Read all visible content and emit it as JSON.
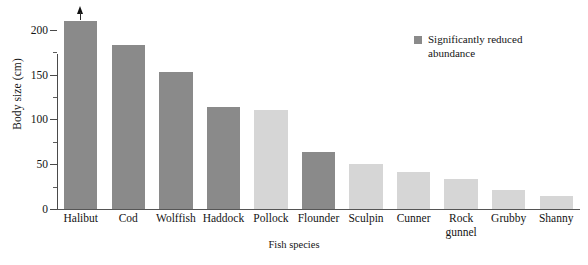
{
  "chart_data": {
    "type": "bar",
    "title": "",
    "xlabel": "Fish species",
    "ylabel": "Body size (cm)",
    "ylim": [
      0,
      220
    ],
    "yticks": [
      0,
      50,
      100,
      150,
      200
    ],
    "ytick_labels": [
      "0",
      "50",
      "100",
      "150",
      "200"
    ],
    "yminor_ticks": [
      25,
      75,
      125,
      175
    ],
    "grid": false,
    "categories": [
      "Halibut",
      "Cod",
      "Wolffish",
      "Haddock",
      "Pollock",
      "Flounder",
      "Sculpin",
      "Cunner",
      "Rock gunnel",
      "Grubby",
      "Shanny"
    ],
    "values": [
      210,
      183,
      153,
      114,
      111,
      64,
      50,
      41,
      33,
      21,
      14
    ],
    "bar_states": [
      "reduced",
      "reduced",
      "reduced",
      "reduced",
      "not-reduced",
      "reduced",
      "not-reduced",
      "not-reduced",
      "not-reduced",
      "not-reduced",
      "not-reduced"
    ],
    "annotations": [
      {
        "category": "Halibut",
        "kind": "up-arrow",
        "note": "value extends beyond axis"
      }
    ],
    "legend": {
      "position": "top-right",
      "entries": [
        {
          "label": "Significantly reduced abundance",
          "color": "#8a8a8a"
        }
      ]
    },
    "colors": {
      "reduced": "#8a8a8a",
      "not_reduced": "#d6d6d6",
      "axis": "#4a4a4a",
      "text": "#141414"
    }
  },
  "axis": {
    "y_title": "Body size (cm)",
    "x_title": "Fish species",
    "y_tick_labels": [
      "200",
      "150",
      "100",
      "50",
      "0"
    ]
  },
  "legend": {
    "label_line1": "Significantly reduced",
    "label_line2": "abundance",
    "label_full": "Significantly reduced abundance"
  },
  "categories": [
    {
      "label": "Halibut",
      "line2": ""
    },
    {
      "label": "Cod",
      "line2": ""
    },
    {
      "label": "Wolffish",
      "line2": ""
    },
    {
      "label": "Haddock",
      "line2": ""
    },
    {
      "label": "Pollock",
      "line2": ""
    },
    {
      "label": "Flounder",
      "line2": ""
    },
    {
      "label": "Sculpin",
      "line2": ""
    },
    {
      "label": "Cunner",
      "line2": ""
    },
    {
      "label": "Rock",
      "line2": "gunnel"
    },
    {
      "label": "Grubby",
      "line2": ""
    },
    {
      "label": "Shanny",
      "line2": ""
    }
  ]
}
